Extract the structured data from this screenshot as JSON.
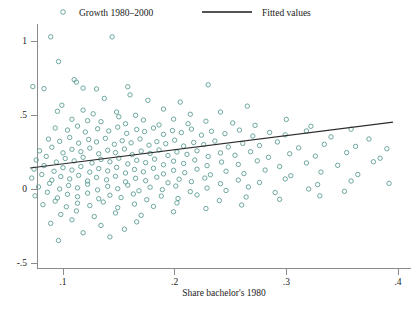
{
  "figure": {
    "background": "#ffffff",
    "marker_color": "#5d9e95",
    "fit_color": "#2b2b2b",
    "axis_color": "#8a8a8a"
  },
  "legend": {
    "position": "top",
    "entries": [
      {
        "label": "Growth 1980–2000",
        "glyph": "circle-marker-icon",
        "type": "scatter"
      },
      {
        "label": "Fitted values",
        "glyph": "line-segment-icon",
        "type": "line"
      }
    ]
  },
  "axes": {
    "x": {
      "label": "Share bachelor's 1980",
      "ticks": [
        ".1",
        ".2",
        ".3",
        ".4"
      ],
      "tick_values": [
        0.1,
        0.2,
        0.3,
        0.4
      ],
      "range": [
        0.068,
        0.405
      ]
    },
    "y": {
      "label": "",
      "ticks": [
        "1",
        ".5",
        "0",
        "-.5"
      ],
      "tick_values": [
        1,
        0.5,
        0,
        -0.5
      ],
      "range": [
        -0.56,
        1.16
      ]
    }
  },
  "chart_data": {
    "type": "scatter",
    "title": "",
    "xlabel": "Share bachelor's 1980",
    "ylabel": "",
    "xlim": [
      0.068,
      0.405
    ],
    "ylim": [
      -0.56,
      1.16
    ],
    "grid": false,
    "legend_position": "top",
    "series": [
      {
        "name": "Growth 1980–2000",
        "type": "scatter",
        "marker": "open-circle",
        "color": "#5d9e95",
        "points": [
          [
            0.089,
            1.028
          ],
          [
            0.144,
            1.028
          ],
          [
            0.096,
            0.861
          ],
          [
            0.11,
            0.739
          ],
          [
            0.112,
            0.722
          ],
          [
            0.073,
            0.692
          ],
          [
            0.083,
            0.678
          ],
          [
            0.118,
            0.682
          ],
          [
            0.13,
            0.676
          ],
          [
            0.158,
            0.691
          ],
          [
            0.23,
            0.704
          ],
          [
            0.16,
            0.636
          ],
          [
            0.205,
            0.587
          ],
          [
            0.099,
            0.566
          ],
          [
            0.137,
            0.612
          ],
          [
            0.176,
            0.599
          ],
          [
            0.265,
            0.56
          ],
          [
            0.095,
            0.525
          ],
          [
            0.118,
            0.533
          ],
          [
            0.127,
            0.508
          ],
          [
            0.148,
            0.52
          ],
          [
            0.165,
            0.498
          ],
          [
            0.19,
            0.54
          ],
          [
            0.214,
            0.505
          ],
          [
            0.241,
            0.52
          ],
          [
            0.108,
            0.471
          ],
          [
            0.122,
            0.462
          ],
          [
            0.134,
            0.455
          ],
          [
            0.15,
            0.488
          ],
          [
            0.156,
            0.441
          ],
          [
            0.172,
            0.466
          ],
          [
            0.186,
            0.433
          ],
          [
            0.199,
            0.472
          ],
          [
            0.212,
            0.441
          ],
          [
            0.228,
            0.458
          ],
          [
            0.252,
            0.446
          ],
          [
            0.272,
            0.43
          ],
          [
            0.3,
            0.47
          ],
          [
            0.322,
            0.424
          ],
          [
            0.358,
            0.404
          ],
          [
            0.093,
            0.412
          ],
          [
            0.104,
            0.398
          ],
          [
            0.113,
            0.425
          ],
          [
            0.12,
            0.385
          ],
          [
            0.131,
            0.407
          ],
          [
            0.141,
            0.392
          ],
          [
            0.149,
            0.418
          ],
          [
            0.157,
            0.376
          ],
          [
            0.166,
            0.402
          ],
          [
            0.173,
            0.388
          ],
          [
            0.181,
            0.412
          ],
          [
            0.19,
            0.369
          ],
          [
            0.198,
            0.395
          ],
          [
            0.206,
            0.381
          ],
          [
            0.215,
            0.405
          ],
          [
            0.224,
            0.364
          ],
          [
            0.233,
            0.39
          ],
          [
            0.245,
            0.374
          ],
          [
            0.258,
            0.398
          ],
          [
            0.27,
            0.358
          ],
          [
            0.285,
            0.382
          ],
          [
            0.299,
            0.366
          ],
          [
            0.318,
            0.392
          ],
          [
            0.34,
            0.352
          ],
          [
            0.374,
            0.338
          ],
          [
            0.087,
            0.337
          ],
          [
            0.097,
            0.322
          ],
          [
            0.106,
            0.348
          ],
          [
            0.114,
            0.31
          ],
          [
            0.123,
            0.334
          ],
          [
            0.13,
            0.318
          ],
          [
            0.138,
            0.342
          ],
          [
            0.146,
            0.302
          ],
          [
            0.153,
            0.326
          ],
          [
            0.161,
            0.312
          ],
          [
            0.169,
            0.338
          ],
          [
            0.177,
            0.296
          ],
          [
            0.184,
            0.32
          ],
          [
            0.192,
            0.306
          ],
          [
            0.2,
            0.33
          ],
          [
            0.208,
            0.29
          ],
          [
            0.217,
            0.314
          ],
          [
            0.226,
            0.3
          ],
          [
            0.236,
            0.324
          ],
          [
            0.248,
            0.284
          ],
          [
            0.261,
            0.308
          ],
          [
            0.276,
            0.294
          ],
          [
            0.292,
            0.318
          ],
          [
            0.311,
            0.278
          ],
          [
            0.334,
            0.302
          ],
          [
            0.362,
            0.288
          ],
          [
            0.39,
            0.272
          ],
          [
            0.079,
            0.258
          ],
          [
            0.09,
            0.282
          ],
          [
            0.1,
            0.244
          ],
          [
            0.108,
            0.268
          ],
          [
            0.116,
            0.252
          ],
          [
            0.124,
            0.276
          ],
          [
            0.132,
            0.238
          ],
          [
            0.14,
            0.262
          ],
          [
            0.147,
            0.246
          ],
          [
            0.155,
            0.27
          ],
          [
            0.162,
            0.232
          ],
          [
            0.17,
            0.256
          ],
          [
            0.178,
            0.24
          ],
          [
            0.186,
            0.264
          ],
          [
            0.194,
            0.226
          ],
          [
            0.202,
            0.25
          ],
          [
            0.211,
            0.234
          ],
          [
            0.22,
            0.258
          ],
          [
            0.23,
            0.22
          ],
          [
            0.241,
            0.244
          ],
          [
            0.254,
            0.228
          ],
          [
            0.268,
            0.252
          ],
          [
            0.284,
            0.214
          ],
          [
            0.303,
            0.238
          ],
          [
            0.326,
            0.222
          ],
          [
            0.354,
            0.246
          ],
          [
            0.384,
            0.208
          ],
          [
            0.076,
            0.196
          ],
          [
            0.085,
            0.22
          ],
          [
            0.094,
            0.182
          ],
          [
            0.102,
            0.206
          ],
          [
            0.11,
            0.19
          ],
          [
            0.118,
            0.214
          ],
          [
            0.126,
            0.176
          ],
          [
            0.134,
            0.2
          ],
          [
            0.142,
            0.184
          ],
          [
            0.15,
            0.208
          ],
          [
            0.158,
            0.17
          ],
          [
            0.166,
            0.194
          ],
          [
            0.174,
            0.178
          ],
          [
            0.182,
            0.202
          ],
          [
            0.19,
            0.164
          ],
          [
            0.199,
            0.188
          ],
          [
            0.208,
            0.172
          ],
          [
            0.218,
            0.196
          ],
          [
            0.229,
            0.158
          ],
          [
            0.242,
            0.182
          ],
          [
            0.257,
            0.166
          ],
          [
            0.274,
            0.19
          ],
          [
            0.294,
            0.152
          ],
          [
            0.318,
            0.176
          ],
          [
            0.346,
            0.16
          ],
          [
            0.378,
            0.184
          ],
          [
            0.074,
            0.134
          ],
          [
            0.083,
            0.158
          ],
          [
            0.092,
            0.12
          ],
          [
            0.1,
            0.144
          ],
          [
            0.108,
            0.128
          ],
          [
            0.116,
            0.152
          ],
          [
            0.124,
            0.114
          ],
          [
            0.132,
            0.138
          ],
          [
            0.14,
            0.122
          ],
          [
            0.148,
            0.146
          ],
          [
            0.156,
            0.108
          ],
          [
            0.164,
            0.132
          ],
          [
            0.172,
            0.116
          ],
          [
            0.181,
            0.14
          ],
          [
            0.19,
            0.102
          ],
          [
            0.199,
            0.126
          ],
          [
            0.209,
            0.11
          ],
          [
            0.22,
            0.134
          ],
          [
            0.232,
            0.096
          ],
          [
            0.246,
            0.12
          ],
          [
            0.262,
            0.104
          ],
          [
            0.281,
            0.128
          ],
          [
            0.304,
            0.09
          ],
          [
            0.331,
            0.114
          ],
          [
            0.364,
            0.098
          ],
          [
            0.072,
            0.074
          ],
          [
            0.081,
            0.098
          ],
          [
            0.09,
            0.06
          ],
          [
            0.098,
            0.084
          ],
          [
            0.106,
            0.068
          ],
          [
            0.114,
            0.092
          ],
          [
            0.122,
            0.054
          ],
          [
            0.13,
            0.078
          ],
          [
            0.139,
            0.062
          ],
          [
            0.147,
            0.086
          ],
          [
            0.156,
            0.048
          ],
          [
            0.165,
            0.072
          ],
          [
            0.174,
            0.056
          ],
          [
            0.184,
            0.08
          ],
          [
            0.194,
            0.042
          ],
          [
            0.204,
            0.066
          ],
          [
            0.215,
            0.05
          ],
          [
            0.227,
            0.074
          ],
          [
            0.241,
            0.036
          ],
          [
            0.257,
            0.06
          ],
          [
            0.276,
            0.044
          ],
          [
            0.299,
            0.068
          ],
          [
            0.328,
            0.03
          ],
          [
            0.358,
            0.054
          ],
          [
            0.392,
            0.038
          ],
          [
            0.078,
            0.014
          ],
          [
            0.088,
            0.038
          ],
          [
            0.097,
            0.0
          ],
          [
            0.105,
            0.024
          ],
          [
            0.113,
            0.008
          ],
          [
            0.122,
            0.032
          ],
          [
            0.131,
            -0.006
          ],
          [
            0.14,
            0.018
          ],
          [
            0.149,
            0.002
          ],
          [
            0.158,
            0.026
          ],
          [
            0.168,
            -0.012
          ],
          [
            0.178,
            0.012
          ],
          [
            0.189,
            -0.004
          ],
          [
            0.201,
            0.02
          ],
          [
            0.214,
            -0.018
          ],
          [
            0.229,
            0.006
          ],
          [
            0.246,
            -0.01
          ],
          [
            0.266,
            0.014
          ],
          [
            0.29,
            -0.024
          ],
          [
            0.32,
            0.0
          ],
          [
            0.352,
            -0.016
          ],
          [
            0.075,
            -0.046
          ],
          [
            0.086,
            -0.022
          ],
          [
            0.095,
            -0.06
          ],
          [
            0.104,
            -0.036
          ],
          [
            0.113,
            -0.052
          ],
          [
            0.122,
            -0.028
          ],
          [
            0.132,
            -0.066
          ],
          [
            0.142,
            -0.042
          ],
          [
            0.152,
            -0.058
          ],
          [
            0.163,
            -0.034
          ],
          [
            0.175,
            -0.072
          ],
          [
            0.188,
            -0.048
          ],
          [
            0.203,
            -0.064
          ],
          [
            0.22,
            -0.04
          ],
          [
            0.24,
            -0.078
          ],
          [
            0.264,
            -0.054
          ],
          [
            0.294,
            -0.07
          ],
          [
            0.33,
            -0.046
          ],
          [
            0.082,
            -0.106
          ],
          [
            0.093,
            -0.082
          ],
          [
            0.103,
            -0.12
          ],
          [
            0.113,
            -0.096
          ],
          [
            0.124,
            -0.112
          ],
          [
            0.136,
            -0.088
          ],
          [
            0.149,
            -0.126
          ],
          [
            0.164,
            -0.102
          ],
          [
            0.181,
            -0.118
          ],
          [
            0.202,
            -0.094
          ],
          [
            0.228,
            -0.132
          ],
          [
            0.26,
            -0.108
          ],
          [
            0.098,
            -0.172
          ],
          [
            0.112,
            -0.148
          ],
          [
            0.128,
            -0.186
          ],
          [
            0.147,
            -0.162
          ],
          [
            0.17,
            -0.178
          ],
          [
            0.199,
            -0.154
          ],
          [
            0.089,
            -0.232
          ],
          [
            0.108,
            -0.208
          ],
          [
            0.134,
            -0.246
          ],
          [
            0.166,
            -0.222
          ],
          [
            0.118,
            -0.296
          ],
          [
            0.155,
            -0.272
          ],
          [
            0.096,
            -0.348
          ],
          [
            0.142,
            -0.324
          ]
        ]
      },
      {
        "name": "Fitted values",
        "type": "line",
        "color": "#2b2b2b",
        "endpoints": [
          [
            0.0705,
            0.142
          ],
          [
            0.3955,
            0.452
          ]
        ]
      }
    ]
  }
}
